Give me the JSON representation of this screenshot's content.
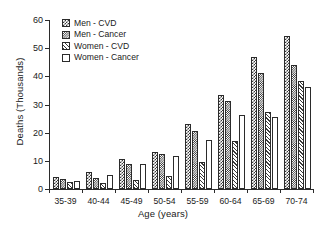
{
  "chart_data": {
    "type": "bar",
    "title": "",
    "subtitle": "",
    "xlabel": "Age (years)",
    "ylabel": "Deaths (Thousands)",
    "categories": [
      "35-39",
      "40-44",
      "45-49",
      "50-54",
      "55-59",
      "60-64",
      "65-69",
      "70-74"
    ],
    "ylim": [
      0,
      60
    ],
    "yticks": [
      0,
      10,
      20,
      30,
      40,
      50,
      60
    ],
    "ytick_labels": [
      "0",
      "10",
      "20",
      "30",
      "40",
      "50",
      "60"
    ],
    "grid": false,
    "legend_position": "upper-left inside",
    "annotations": [],
    "series": [
      {
        "name": "Men - CVD",
        "pattern": "checker-dark",
        "color": "#3a3a3a",
        "values": [
          4.3,
          5.9,
          10.8,
          13.2,
          23.2,
          33.3,
          47.0,
          54.2
        ]
      },
      {
        "name": "Men - Cancer",
        "pattern": "checker-fine",
        "color": "#262626",
        "values": [
          3.4,
          4.0,
          8.9,
          12.3,
          20.5,
          31.2,
          41.3,
          44.2
        ]
      },
      {
        "name": "Women - CVD",
        "pattern": "diagonal-hatch",
        "color": "#3a3a3a",
        "values": [
          2.4,
          2.2,
          3.2,
          4.6,
          9.5,
          17.1,
          27.3,
          38.2
        ]
      },
      {
        "name": "Women - Cancer",
        "pattern": "blank",
        "color": "#ffffff",
        "values": [
          2.9,
          5.1,
          8.9,
          11.6,
          17.4,
          26.2,
          25.5,
          36.2
        ]
      }
    ]
  },
  "axis": {
    "stroke": "#2b2b2b"
  }
}
